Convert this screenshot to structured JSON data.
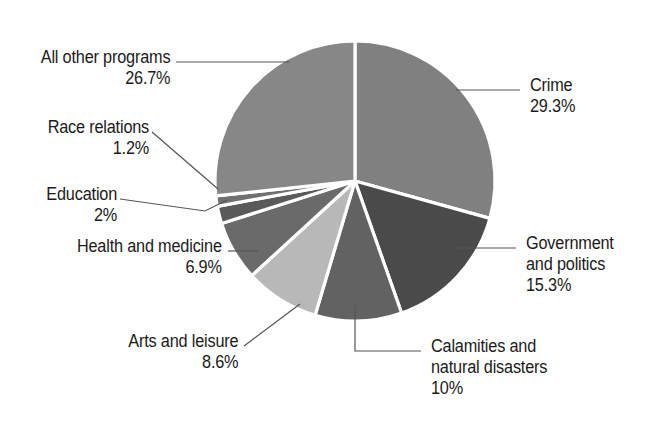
{
  "figure": {
    "background_color": "#ffffff",
    "leader_line_color": "#555555",
    "slice_border_color": "#ffffff"
  },
  "chart_data": {
    "type": "pie",
    "title": "",
    "subtitle": "",
    "xlabel": "",
    "ylabel": "",
    "legend_position": "none",
    "grid": false,
    "start_angle_deg": 0,
    "direction": "clockwise",
    "units": "percent",
    "total": 100,
    "categories": [
      "Crime",
      "Government and politics",
      "Calamities and natural disasters",
      "Arts and leisure",
      "Health and medicine",
      "Education",
      "Race relations",
      "All other programs"
    ],
    "values": [
      29.3,
      15.3,
      10,
      8.6,
      6.9,
      2,
      1.2,
      26.7
    ],
    "value_labels": [
      "29.3%",
      "15.3%",
      "10%",
      "8.6%",
      "6.9%",
      "2%",
      "1.2%",
      "26.7%"
    ],
    "colors": [
      "#808080",
      "#4a4a4a",
      "#626262",
      "#b8b8b8",
      "#6a6a6a",
      "#5a5a5a",
      "#707070",
      "#878787"
    ],
    "slices": [
      {
        "name": "Crime",
        "value": 29.3,
        "value_label": "29.3%",
        "color": "#808080"
      },
      {
        "name": "Government and politics",
        "value": 15.3,
        "value_label": "15.3%",
        "color": "#4a4a4a"
      },
      {
        "name": "Calamities and natural disasters",
        "value": 10,
        "value_label": "10%",
        "color": "#626262"
      },
      {
        "name": "Arts and leisure",
        "value": 8.6,
        "value_label": "8.6%",
        "color": "#b8b8b8"
      },
      {
        "name": "Health and medicine",
        "value": 6.9,
        "value_label": "6.9%",
        "color": "#6a6a6a"
      },
      {
        "name": "Education",
        "value": 2,
        "value_label": "2%",
        "color": "#5a5a5a"
      },
      {
        "name": "Race relations",
        "value": 1.2,
        "value_label": "1.2%",
        "color": "#707070"
      },
      {
        "name": "All other programs",
        "value": 26.7,
        "value_label": "26.7%",
        "color": "#878787"
      }
    ]
  },
  "labels": {
    "all_other_programs": {
      "name": "All other programs",
      "pct": "26.7%"
    },
    "race_relations": {
      "name": "Race relations",
      "pct": "1.2%"
    },
    "education": {
      "name": "Education",
      "pct": "2%"
    },
    "health_and_medicine": {
      "name": "Health and medicine",
      "pct": "6.9%"
    },
    "arts_and_leisure": {
      "name": "Arts and leisure",
      "pct": "8.6%"
    },
    "crime": {
      "name": "Crime",
      "pct": "29.3%"
    },
    "government": {
      "name_line1": "Government",
      "name_line2": "and politics",
      "pct": "15.3%"
    },
    "calamities": {
      "name_line1": "Calamities and",
      "name_line2": "natural disasters",
      "pct": "10%"
    }
  }
}
